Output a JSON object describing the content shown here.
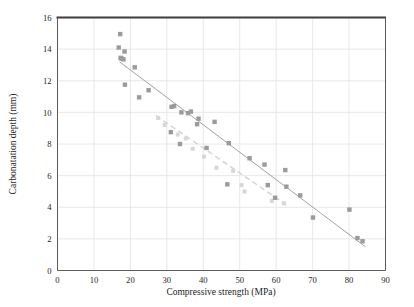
{
  "chart_data": {
    "type": "scatter",
    "title": "",
    "xlabel": "Compressive strength (MPa)",
    "ylabel": "Carbonatation depth (mm)",
    "xlim": [
      0,
      90
    ],
    "ylim": [
      0,
      16
    ],
    "xticks": [
      0,
      10,
      20,
      30,
      40,
      50,
      60,
      70,
      80,
      90
    ],
    "yticks": [
      0,
      2,
      4,
      6,
      8,
      10,
      12,
      14,
      16
    ],
    "grid": true,
    "legend_position": "none",
    "series": [
      {
        "name": "series-dark",
        "marker": "square",
        "marker_color": "#9b9b9b",
        "line_color": "#a2a2a2",
        "line_style": "solid",
        "points": [
          [
            17.2,
            14.95
          ],
          [
            16.8,
            14.1
          ],
          [
            18.4,
            13.85
          ],
          [
            17.6,
            13.4
          ],
          [
            18.1,
            13.35
          ],
          [
            17.3,
            13.45
          ],
          [
            21.2,
            12.85
          ],
          [
            18.5,
            11.75
          ],
          [
            25.0,
            11.4
          ],
          [
            22.4,
            10.95
          ],
          [
            31.3,
            10.35
          ],
          [
            32.0,
            10.4
          ],
          [
            34.0,
            10.0
          ],
          [
            35.8,
            9.95
          ],
          [
            36.6,
            10.05
          ],
          [
            38.7,
            9.6
          ],
          [
            38.3,
            9.25
          ],
          [
            43.1,
            9.4
          ],
          [
            31.1,
            8.75
          ],
          [
            33.6,
            8.0
          ],
          [
            47.0,
            8.05
          ],
          [
            40.9,
            7.75
          ],
          [
            52.7,
            7.1
          ],
          [
            56.8,
            6.7
          ],
          [
            62.5,
            6.35
          ],
          [
            46.6,
            5.45
          ],
          [
            57.7,
            5.4
          ],
          [
            62.8,
            5.3
          ],
          [
            59.7,
            4.6
          ],
          [
            66.6,
            4.75
          ],
          [
            70.1,
            3.35
          ],
          [
            80.1,
            3.85
          ],
          [
            82.3,
            2.05
          ],
          [
            83.7,
            1.85
          ]
        ],
        "trend": {
          "x1": 17.0,
          "y1": 13.2,
          "x2": 84.5,
          "y2": 1.5
        }
      },
      {
        "name": "series-light",
        "marker": "square",
        "marker_color": "#d7d7d7",
        "line_color": "#d2d2d2",
        "line_style": "dashed",
        "points": [
          [
            27.6,
            9.65
          ],
          [
            29.4,
            9.2
          ],
          [
            33.0,
            8.6
          ],
          [
            35.2,
            8.35
          ],
          [
            37.1,
            7.7
          ],
          [
            40.2,
            7.2
          ],
          [
            43.6,
            6.5
          ],
          [
            48.2,
            6.3
          ],
          [
            50.5,
            5.4
          ],
          [
            51.3,
            5.0
          ],
          [
            58.8,
            4.4
          ],
          [
            62.1,
            4.25
          ]
        ],
        "trend": {
          "x1": 27.0,
          "y1": 9.8,
          "x2": 62.8,
          "y2": 4.15
        }
      }
    ]
  },
  "axes": {
    "xlabel": "Compressive strength (MPa)",
    "ylabel": "Carbonatation depth (mm)",
    "xticklabels": [
      "0",
      "10",
      "20",
      "30",
      "40",
      "50",
      "60",
      "70",
      "80",
      "90"
    ],
    "yticklabels": [
      "0",
      "2",
      "4",
      "6",
      "8",
      "10",
      "12",
      "14",
      "16"
    ]
  },
  "colors": {
    "background": "#ffffff",
    "grid": "#e2e2e2",
    "axis": "#4a4a4a",
    "top_border": "#3c3c3c",
    "series_dark": "#9b9b9b",
    "series_light": "#d7d7d7",
    "text": "#1d1d1d"
  }
}
